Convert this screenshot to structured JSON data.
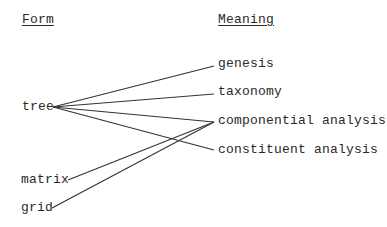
{
  "headers": {
    "form": "Form",
    "meaning": "Meaning"
  },
  "forms": [
    {
      "id": "tree",
      "label": "tree"
    },
    {
      "id": "matrix",
      "label": "matrix"
    },
    {
      "id": "grid",
      "label": "grid"
    }
  ],
  "meanings": [
    {
      "id": "genesis",
      "label": "genesis"
    },
    {
      "id": "taxonomy",
      "label": "taxonomy"
    },
    {
      "id": "componential-analysis",
      "label": "componential analysis"
    },
    {
      "id": "constituent-analysis",
      "label": "constituent analysis"
    }
  ],
  "links": [
    {
      "from": "tree",
      "to": "genesis"
    },
    {
      "from": "tree",
      "to": "taxonomy"
    },
    {
      "from": "tree",
      "to": "componential analysis"
    },
    {
      "from": "tree",
      "to": "constituent analysis"
    },
    {
      "from": "matrix",
      "to": "componential analysis"
    },
    {
      "from": "grid",
      "to": "componential analysis"
    }
  ],
  "colors": {
    "text": "#2a2a2a",
    "line": "#333333",
    "background": "#ffffff"
  }
}
